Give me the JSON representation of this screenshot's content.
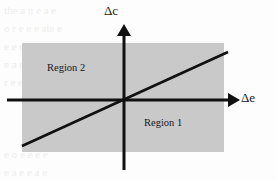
{
  "figure": {
    "type": "cartesian-quadrant-diagram",
    "background_color": "#fdfdfd",
    "shaded_color": "#c9c9c9",
    "stroke_color": "#111111"
  },
  "axes": {
    "vertical": {
      "name": "delta-c-axis",
      "label": "Δc",
      "label_delta": "Δ",
      "label_variable": "c",
      "arrow_direction": "up",
      "x": 124,
      "top": 27,
      "bottom": 170
    },
    "horizontal": {
      "name": "delta-e-axis",
      "label": "Δe",
      "label_delta": "Δ",
      "label_variable": "e",
      "arrow_direction": "right",
      "y": 100,
      "left": 7,
      "right": 237
    },
    "origin": {
      "x": 124,
      "y": 100
    }
  },
  "shaded_rectangle": {
    "x": 22,
    "y": 43,
    "width": 202,
    "height": 109,
    "color": "#c9c9c9"
  },
  "boundary_line": {
    "name": "region-boundary-line",
    "x1": 22,
    "y1": 146,
    "x2": 228,
    "y2": 52
  },
  "regions": [
    {
      "id": "region-1",
      "label": "Region 1",
      "position": "lower-right"
    },
    {
      "id": "region-2",
      "label": "Region 2",
      "position": "upper-left"
    }
  ],
  "chart_data": {
    "type": "scatter",
    "title": "",
    "xlabel": "Δe",
    "ylabel": "Δc",
    "xlim": [
      -1,
      1
    ],
    "ylim": [
      -1,
      1
    ],
    "grid": false,
    "legend": false,
    "annotations": [
      "Region 1",
      "Region 2"
    ],
    "series": [
      {
        "name": "boundary-line",
        "x": [
          -1.0,
          1.0
        ],
        "y": [
          -0.45,
          0.45
        ]
      }
    ]
  },
  "background_artifacts": {
    "note": "faint scanned page bleed-through text",
    "lines": [
      {
        "text": "the a u e    a   e",
        "left": 4,
        "top": 4
      },
      {
        "text": "o   r    e   e   e   ate     e",
        "left": 4,
        "top": 22
      },
      {
        "text": "e   e    e   e   a   e   a   e",
        "left": 4,
        "top": 40
      },
      {
        "text": "e   a   e   e   a   e   e",
        "left": 4,
        "top": 58
      },
      {
        "text": "r  e   e   e  a   e   e",
        "left": 4,
        "top": 76
      },
      {
        "text": "e   o   e   e   e   e",
        "left": 4,
        "top": 148
      },
      {
        "text": "e a   e    e   a   e",
        "left": 4,
        "top": 166
      }
    ]
  }
}
